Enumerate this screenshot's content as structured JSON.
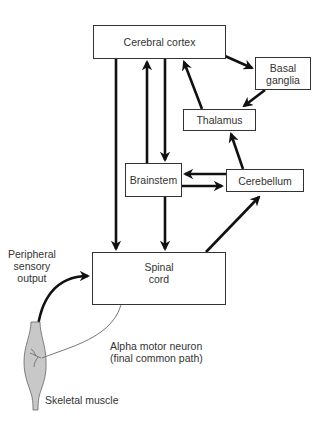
{
  "diagram": {
    "nodes": {
      "cerebral_cortex": "Cerebral cortex",
      "basal_ganglia": "Basal\nganglia",
      "thalamus": "Thalamus",
      "brainstem": "Brainstem",
      "cerebellum": "Cerebellum",
      "spinal_cord": "Spinal\ncord"
    },
    "labels": {
      "peripheral": "Peripheral\nsensory\noutput",
      "alpha_motor": "Alpha motor neuron\n(final common path)",
      "skeletal_muscle": "Skeletal muscle"
    },
    "edges": [
      {
        "from": "Cerebral cortex",
        "to": "Basal ganglia"
      },
      {
        "from": "Basal ganglia",
        "to": "Thalamus"
      },
      {
        "from": "Thalamus",
        "to": "Cerebral cortex"
      },
      {
        "from": "Cerebellum",
        "to": "Thalamus"
      },
      {
        "from": "Cerebral cortex",
        "to": "Brainstem"
      },
      {
        "from": "Brainstem",
        "to": "Cerebral cortex"
      },
      {
        "from": "Cerebral cortex",
        "to": "Spinal cord"
      },
      {
        "from": "Cerebellum",
        "to": "Brainstem"
      },
      {
        "from": "Brainstem",
        "to": "Cerebellum"
      },
      {
        "from": "Brainstem",
        "to": "Spinal cord"
      },
      {
        "from": "Spinal cord",
        "to": "Cerebellum"
      },
      {
        "from": "Skeletal muscle",
        "to": "Spinal cord"
      }
    ],
    "colors": {
      "line": "#111111",
      "box_border": "#333333",
      "muscle_fill": "#c8c8c8",
      "neuron_fill": "#cfcfcf"
    }
  }
}
